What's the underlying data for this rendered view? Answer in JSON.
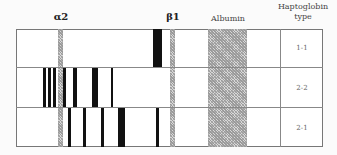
{
  "headers": {
    "alpha2": "α2",
    "beta1": "β1",
    "albumin": "Albumin",
    "haptoglobin_line1": "Haptoglobin",
    "haptoglobin_line2": "type"
  },
  "rows": [
    {
      "type": "1-1",
      "bands": [
        [
          153,
          9
        ]
      ]
    },
    {
      "type": "2-2",
      "bands": [
        [
          43,
          3
        ],
        [
          48,
          3
        ],
        [
          53,
          3
        ],
        [
          63,
          3
        ],
        [
          73,
          4
        ],
        [
          92,
          6
        ],
        [
          111,
          2
        ]
      ]
    },
    {
      "type": "2-1",
      "bands": [
        [
          68,
          3
        ],
        [
          83,
          3
        ],
        [
          101,
          3
        ],
        [
          118,
          7
        ],
        [
          156,
          3
        ]
      ]
    }
  ],
  "hatched_columns": {
    "alpha2": [
      58,
      5
    ],
    "beta1": [
      170,
      5
    ],
    "albumin": [
      208,
      39
    ]
  }
}
